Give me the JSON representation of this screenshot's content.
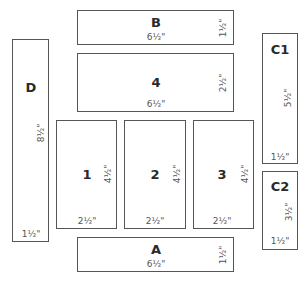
{
  "pieces": {
    "B": {
      "label": "B",
      "width": "6½\"",
      "height": "1½\""
    },
    "P4": {
      "label": "4",
      "width": "6½\"",
      "height": "2½\""
    },
    "D": {
      "label": "D",
      "width": "1½\"",
      "height": "8½\""
    },
    "P1": {
      "label": "1",
      "width": "2½\"",
      "height": "4½\""
    },
    "P2": {
      "label": "2",
      "width": "2½\"",
      "height": "4½\""
    },
    "P3": {
      "label": "3",
      "width": "2½\"",
      "height": "4½\""
    },
    "A": {
      "label": "A",
      "width": "6½\"",
      "height": "1½\""
    },
    "C1": {
      "label": "C1",
      "width": "1½\"",
      "height": "5½\""
    },
    "C2": {
      "label": "C2",
      "width": "1½\"",
      "height": "3½\""
    }
  },
  "colors": {
    "border": "#555555",
    "background": "#ffffff",
    "text": "#2a2a2a"
  }
}
